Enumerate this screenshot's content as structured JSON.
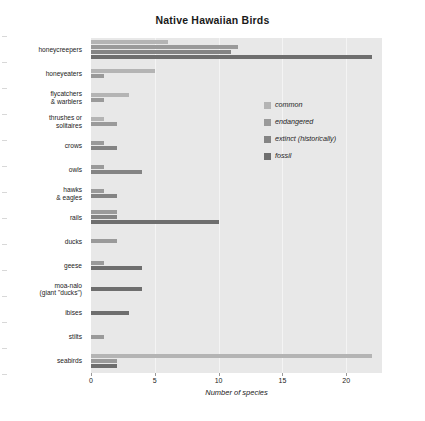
{
  "chart_data": {
    "type": "bar",
    "orientation": "horizontal",
    "title": "Native Hawaiian Birds",
    "xlabel": "Number of species",
    "ylabel": "",
    "xlim": [
      0,
      22.8
    ],
    "xticks": [
      0,
      5,
      10,
      15,
      20
    ],
    "xticklabels": [
      "0",
      "5",
      "10",
      "15",
      "20"
    ],
    "grid": "vertical",
    "legend_position": "upper center-right",
    "categories": [
      "honeycreepers",
      "honeyeaters",
      "flycatchers\n& warblers",
      "thrushes or\nsolitaires",
      "crows",
      "owls",
      "hawks\n& eagles",
      "rails",
      "ducks",
      "geese",
      "moa-nalo\n(giant \"ducks\")",
      "ibises",
      "stilts",
      "seabirds"
    ],
    "series": [
      {
        "name": "common",
        "color": "#b4b4b4",
        "values": [
          6,
          5,
          3,
          1,
          0,
          0,
          0,
          0,
          0,
          0,
          0,
          0,
          0,
          22
        ]
      },
      {
        "name": "endangered",
        "color": "#9a9a9a",
        "values": [
          11.5,
          1,
          1,
          2,
          1,
          1,
          1,
          2,
          2,
          1,
          0,
          0,
          1,
          2
        ]
      },
      {
        "name": "extinct (historically)",
        "color": "#848484",
        "values": [
          11,
          0,
          0,
          0,
          2,
          4,
          2,
          2,
          0,
          0,
          0,
          0,
          0,
          0
        ]
      },
      {
        "name": "fossil",
        "color": "#6e6e6e",
        "values": [
          22,
          0,
          0,
          0,
          0,
          0,
          0,
          10,
          0,
          4,
          4,
          3,
          0,
          2
        ]
      }
    ]
  },
  "legend": {
    "entries": [
      {
        "label": "common",
        "color": "#b4b4b4"
      },
      {
        "label": "endangered",
        "color": "#9a9a9a"
      },
      {
        "label": "extinct (historically)",
        "color": "#848484"
      },
      {
        "label": "fossil",
        "color": "#6e6e6e"
      }
    ]
  },
  "colors": {
    "plot_background": "#e8e8e8",
    "gridline": "#f4f4f4",
    "page_background": "#ffffff",
    "text": "#222222"
  }
}
